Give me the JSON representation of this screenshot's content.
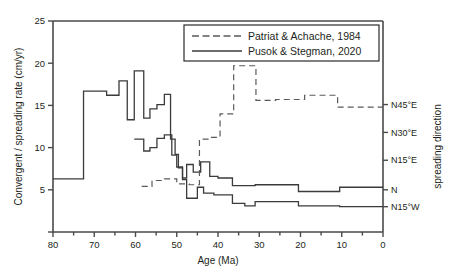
{
  "chart_data": {
    "type": "line",
    "title": "",
    "xlabel": "Age (Ma)",
    "ylabel": "Convergent / spreading rate (cm/yr)",
    "y2label": "spreading direction",
    "xlim": [
      80,
      0
    ],
    "ylim": [
      0,
      25
    ],
    "xticks": [
      80,
      70,
      60,
      50,
      40,
      30,
      20,
      10,
      0
    ],
    "xtick_labels": [
      "80",
      "70",
      "60",
      "50",
      "40",
      "30",
      "20",
      "10",
      "0"
    ],
    "yticks": [
      0,
      5,
      10,
      15,
      20,
      25
    ],
    "ytick_labels": [
      "",
      "5",
      "10",
      "15",
      "20",
      "25"
    ],
    "y2ticks": [
      3,
      5,
      8.5,
      11.8,
      15.1
    ],
    "y2tick_labels": [
      "N15°W",
      "N",
      "N15°E",
      "N30°E",
      "N45°E"
    ],
    "grid": false,
    "legend_position": "top-right",
    "legend": [
      {
        "name": "Patriat & Achache, 1984",
        "style": "dashed"
      },
      {
        "name": "Pusok & Stegman, 2020",
        "style": "solid"
      }
    ],
    "series": [
      {
        "name": "Pusok & Stegman, 2020",
        "style": "solid",
        "step": "post",
        "x": [
          80,
          72.6,
          72.6,
          67.0,
          67.0,
          64.0,
          64.0,
          62.0,
          62.0,
          60.3,
          60.3,
          58.0,
          58.0,
          56.5,
          56.5,
          54.8,
          54.8,
          53.0,
          53.0,
          51.5,
          51.5,
          50.4,
          50.4,
          49.6,
          49.6,
          48.6,
          48.6,
          47.6,
          47.6,
          45.0,
          45.0,
          43.5,
          43.5,
          41.0,
          41.0,
          36.5,
          36.5,
          33.5,
          33.5,
          31.0,
          31.0,
          20.5,
          20.5,
          10.5,
          10.5,
          0
        ],
        "y": [
          6.3,
          6.3,
          16.7,
          16.7,
          16.2,
          16.2,
          17.9,
          17.9,
          13.3,
          13.3,
          19.1,
          19.1,
          13.5,
          13.5,
          14.6,
          14.6,
          15.1,
          15.1,
          16.3,
          16.3,
          11.0,
          11.0,
          9.2,
          9.2,
          7.6,
          7.6,
          6.2,
          6.2,
          4.0,
          4.0,
          5.3,
          5.3,
          4.6,
          4.6,
          4.4,
          4.4,
          3.4,
          3.4,
          3.1,
          3.1,
          3.6,
          3.6,
          3.1,
          3.1,
          3.0,
          3.0
        ]
      },
      {
        "name": "Pusok & Stegman, 2020 (upper)",
        "style": "solid",
        "step": "post",
        "x": [
          60.3,
          58.0,
          58.0,
          56.5,
          56.5,
          54.8,
          54.8,
          53.0,
          53.0,
          51.2,
          51.2,
          50.0,
          50.0,
          48.6,
          48.6,
          47.6,
          47.6,
          46.0,
          46.0,
          44.2,
          44.2,
          42.0,
          42.0,
          40.0,
          40.0,
          36.5,
          36.5,
          31.0,
          31.0,
          20.5,
          20.5,
          10.5,
          10.5,
          0
        ],
        "y": [
          11.0,
          11.0,
          9.6,
          9.6,
          10.0,
          10.0,
          11.1,
          11.1,
          11.5,
          11.5,
          9.1,
          9.1,
          7.7,
          7.7,
          6.4,
          6.4,
          8.0,
          8.0,
          7.1,
          7.1,
          8.3,
          8.3,
          6.6,
          6.6,
          6.4,
          6.4,
          5.5,
          5.5,
          5.6,
          5.6,
          4.8,
          4.8,
          5.3,
          5.3
        ]
      },
      {
        "name": "Patriat & Achache, 1984",
        "style": "dashed",
        "step": "post",
        "x": [
          58.5,
          56.0,
          56.0,
          53.0,
          53.0,
          50.0,
          50.0,
          47.0,
          47.0,
          44.5,
          44.5,
          42.0,
          42.0,
          39.5,
          39.5,
          36.2,
          36.2,
          30.8,
          30.8,
          26.0,
          26.0,
          19.0,
          19.0,
          11.0,
          11.0,
          0
        ],
        "y": [
          5.4,
          5.4,
          6.1,
          6.1,
          6.3,
          6.3,
          5.7,
          5.7,
          5.6,
          5.6,
          11.0,
          11.0,
          11.2,
          11.2,
          14.0,
          14.0,
          19.7,
          19.7,
          15.6,
          15.6,
          15.7,
          15.7,
          16.2,
          16.2,
          14.8,
          14.8
        ]
      }
    ]
  }
}
